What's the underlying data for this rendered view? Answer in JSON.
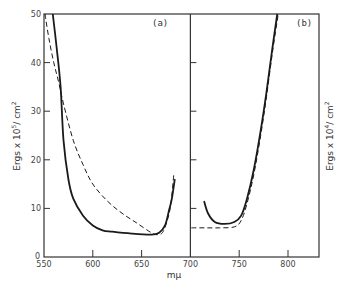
{
  "chart_data": [
    {
      "panel": "(a)",
      "type": "line",
      "xlabel": "mμ",
      "ylabel": "Ergs x 10^5 / cm^2",
      "xlim": [
        550,
        700
      ],
      "ylim": [
        0,
        50
      ],
      "xticks": [
        550,
        600,
        650,
        700
      ],
      "yticks": [
        0,
        10,
        20,
        30,
        40,
        50
      ],
      "grid": false,
      "series": [
        {
          "name": "solid",
          "style": "solid",
          "x": [
            559,
            563,
            567,
            570,
            575,
            580,
            590,
            600,
            610,
            620,
            640,
            660,
            668,
            674,
            678,
            681,
            684
          ],
          "y": [
            50,
            43,
            35,
            24,
            16,
            12,
            8.5,
            6.5,
            5.5,
            5.2,
            4.8,
            4.6,
            5.0,
            6.5,
            9.5,
            12,
            16
          ]
        },
        {
          "name": "dashed",
          "style": "dashed",
          "x": [
            551,
            555,
            560,
            565,
            570,
            580,
            590,
            600,
            615,
            630,
            645,
            660,
            667,
            672,
            677,
            680,
            683
          ],
          "y": [
            50,
            45,
            40,
            36,
            31.5,
            24,
            19,
            15,
            11.5,
            9,
            7,
            5,
            4.6,
            5.2,
            8,
            11,
            17
          ]
        }
      ]
    },
    {
      "panel": "(b)",
      "type": "line",
      "xlabel": "mμ",
      "ylabel": "Ergs x 10^4 / cm^2",
      "xlim": [
        700,
        825
      ],
      "ylim": [
        0,
        50
      ],
      "xticks": [
        700,
        750,
        800
      ],
      "yticks": [
        10,
        20,
        30,
        40
      ],
      "grid": false,
      "series": [
        {
          "name": "solid",
          "style": "solid",
          "x": [
            714,
            718,
            725,
            735,
            745,
            752,
            758,
            765,
            772,
            778,
            784,
            789
          ],
          "y": [
            11.5,
            9,
            7.2,
            6.8,
            7.2,
            8.5,
            12,
            18,
            26,
            34,
            43,
            50
          ]
        },
        {
          "name": "dashed",
          "style": "dashed",
          "x": [
            701,
            715,
            730,
            745,
            752,
            758,
            765,
            772,
            778,
            784,
            790
          ],
          "y": [
            6,
            6,
            6,
            6.2,
            7.5,
            11,
            17,
            25,
            33,
            42,
            50
          ]
        }
      ]
    }
  ],
  "axes": {
    "x_title": "mμ",
    "left_y_title": "Ergs x 10",
    "left_y_exp": "5",
    "left_y_unit": "/ cm",
    "left_y_unit_exp": "2",
    "right_y_title": "Ergs x 10",
    "right_y_exp": "4",
    "right_y_unit": "/ cm",
    "right_y_unit_exp": "2",
    "x_ticks": [
      "550",
      "600",
      "650",
      "700",
      "750",
      "800"
    ],
    "y_ticks": [
      "0",
      "10",
      "20",
      "30",
      "40",
      "50"
    ],
    "panel_a_label": "(a)",
    "panel_b_label": "(b)"
  }
}
